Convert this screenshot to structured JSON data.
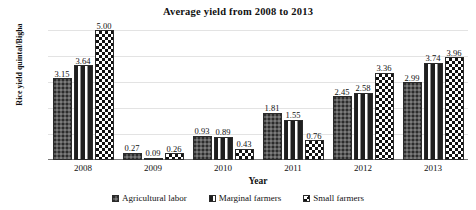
{
  "chart_data": {
    "type": "bar",
    "title": "Average yield from 2008 to 2013",
    "xlabel": "Year",
    "ylabel": "Rice yield quintal/Bigha",
    "categories": [
      "2008",
      "2009",
      "2010",
      "2011",
      "2012",
      "2013"
    ],
    "series": [
      {
        "name": "Agricultural labor",
        "values": [
          3.15,
          0.27,
          0.93,
          1.81,
          2.45,
          2.99
        ],
        "labels": [
          "3.15",
          "0.27",
          "0.93",
          "1.81",
          "2.45",
          "2.99"
        ],
        "fill": "dark-gray-stipple",
        "color": "#595959"
      },
      {
        "name": "Marginal farmers",
        "values": [
          3.64,
          0.09,
          0.89,
          1.55,
          2.58,
          3.74
        ],
        "labels": [
          "3.64",
          "0.09",
          "0.89",
          "1.55",
          "2.58",
          "3.74"
        ],
        "fill": "white-dashed",
        "color": "#ffffff"
      },
      {
        "name": "Small farmers",
        "values": [
          5.0,
          0.26,
          0.43,
          0.76,
          3.36,
          3.96
        ],
        "labels": [
          "5.00",
          "0.26",
          "0.43",
          "0.76",
          "3.36",
          "3.96"
        ],
        "fill": "checkerboard",
        "color": "#111111"
      }
    ],
    "ylim": [
      0,
      5
    ],
    "ytick_labels": [
      "0.00",
      "1.00",
      "2.00",
      "3.00",
      "4.00",
      "5.00"
    ],
    "ytick_values": [
      0,
      1,
      2,
      3,
      4,
      5
    ],
    "grid": true,
    "legend_position": "bottom"
  }
}
